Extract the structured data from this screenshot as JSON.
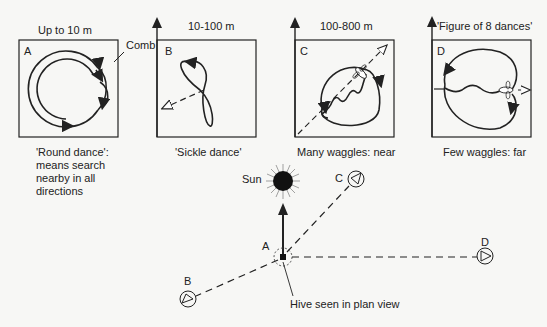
{
  "panels": [
    {
      "letter": "A",
      "distance": "Up to 10 m",
      "caption_lines": [
        "'Round dance':",
        "means search",
        "nearby in all",
        "directions"
      ]
    },
    {
      "letter": "B",
      "distance": "10-100 m",
      "caption_lines": [
        "'Sickle dance'"
      ]
    },
    {
      "letter": "C",
      "distance": "100-800 m",
      "caption_lines": [
        "Many waggles: near"
      ]
    },
    {
      "letter": "D",
      "distance": "'Figure of 8 dances'",
      "caption_lines": [
        "Few waggles: far"
      ]
    }
  ],
  "comb_label": "Comb",
  "map": {
    "sun_label": "Sun",
    "hive_label": "A",
    "hive_caption": "Hive seen in plan view",
    "targets": [
      {
        "letter": "B"
      },
      {
        "letter": "C"
      },
      {
        "letter": "D"
      }
    ]
  },
  "colors": {
    "ink": "#222222",
    "background": "#f7f7f5"
  }
}
